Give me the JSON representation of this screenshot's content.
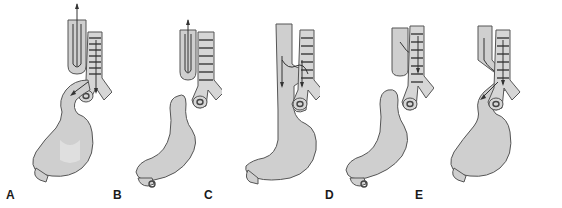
{
  "figure": {
    "panels": [
      {
        "id": "A",
        "label": "A",
        "label_x": 6,
        "description": "esophageal-atresia-with-distal-fistula"
      },
      {
        "id": "B",
        "label": "B",
        "label_x": 112,
        "description": "isolated-esophageal-atresia"
      },
      {
        "id": "C",
        "label": "C",
        "label_x": 204,
        "description": "h-type-fistula"
      },
      {
        "id": "D",
        "label": "D",
        "label_x": 325,
        "description": "atresia-with-proximal-fistula"
      },
      {
        "id": "E",
        "label": "E",
        "label_x": 415,
        "description": "atresia-with-proximal-and-distal-fistula"
      }
    ],
    "colors": {
      "organ_fill": "#cfcfcf",
      "outline": "#555555",
      "label": "#1a1a1a",
      "background": "#ffffff"
    }
  }
}
